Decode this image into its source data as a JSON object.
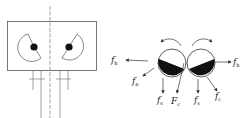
{
  "diagram": {
    "left_panel": {
      "description": "housing with two eccentric rotors and shafts"
    },
    "right_panel": {
      "labels": {
        "left_outward": {
          "main": "f",
          "sub": "h"
        },
        "left_down_left": {
          "main": "f",
          "sub": "n"
        },
        "left_down": {
          "main": "f",
          "sub": "s"
        },
        "center": {
          "main": "F",
          "sub": "c"
        },
        "right_down": {
          "main": "f",
          "sub": "s"
        },
        "right_down_right": {
          "main": "f",
          "sub": "c"
        },
        "right_outward": {
          "main": "f",
          "sub": "h"
        }
      }
    },
    "colors": {
      "stroke": "#333333",
      "fill": "#111111"
    }
  }
}
